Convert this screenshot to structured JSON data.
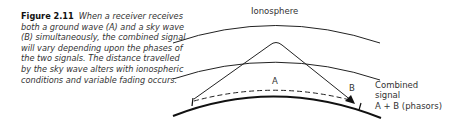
{
  "caption": {
    "figure_label": "Figure 2.11",
    "text": "When a receiver receives both a ground wave (A) and a sky wave (B) simultaneously, the combined signal will vary depending upon the phases of the two signals. The distance travelled by the sky wave alters with ionospheric conditions and variable fading occurs."
  },
  "diagram": {
    "ionosphere_label": "Ionosphere",
    "ground_wave_label": "A",
    "sky_wave_label": "B",
    "combined_label_line1": "Combined",
    "combined_label_line2": "signal",
    "combined_label_line3": "A + B (phasors)"
  }
}
